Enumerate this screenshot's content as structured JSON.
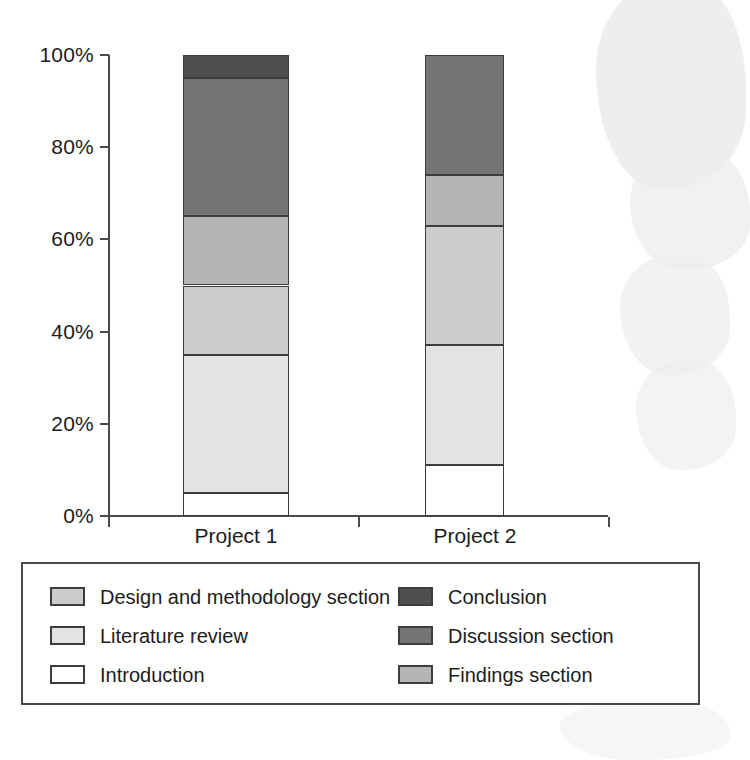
{
  "chart_data": {
    "type": "bar",
    "title": "",
    "subtitle": "",
    "xlabel": "",
    "ylabel": "",
    "stacked": true,
    "stack_mode": "percent",
    "grid": false,
    "legend_position": "bottom",
    "categories": [
      "Project 1",
      "Project 2"
    ],
    "ylim": [
      0,
      100
    ],
    "y_ticks": [
      0,
      20,
      40,
      60,
      80,
      100
    ],
    "y_tick_labels": [
      "0%",
      "20%",
      "40%",
      "60%",
      "80%",
      "100%"
    ],
    "series": [
      {
        "name": "Introduction",
        "color": "#ffffff",
        "values": [
          5,
          11
        ]
      },
      {
        "name": "Literature review",
        "color": "#e3e3e3",
        "values": [
          30,
          26
        ]
      },
      {
        "name": "Design and methodology section",
        "color": "#cccccc",
        "values": [
          15,
          26
        ]
      },
      {
        "name": "Findings section",
        "color": "#b5b5b5",
        "values": [
          15,
          11
        ]
      },
      {
        "name": "Discussion section",
        "color": "#757575",
        "values": [
          30,
          26
        ]
      },
      {
        "name": "Conclusion",
        "color": "#4f4f4f",
        "values": [
          5,
          0
        ]
      }
    ],
    "cumulative_tops": {
      "Project 1": {
        "Introduction": 5,
        "Literature review": 35,
        "Design and methodology section": 50,
        "Findings section": 65,
        "Discussion section": 95,
        "Conclusion": 100
      },
      "Project 2": {
        "Introduction": 11,
        "Literature review": 37,
        "Design and methodology section": 63,
        "Findings section": 74,
        "Discussion section": 100,
        "Conclusion": 100
      }
    },
    "axis_color": "#4a4a4a",
    "bar_outline_color": "#3d3d3d"
  },
  "legend": {
    "columns": [
      [
        {
          "label": "Design and methodology section",
          "color": "#cccccc"
        },
        {
          "label": "Literature review",
          "color": "#e3e3e3"
        },
        {
          "label": "Introduction",
          "color": "#ffffff"
        }
      ],
      [
        {
          "label": "Conclusion",
          "color": "#4f4f4f"
        },
        {
          "label": "Discussion section",
          "color": "#757575"
        },
        {
          "label": "Findings section",
          "color": "#b5b5b5"
        }
      ]
    ]
  }
}
